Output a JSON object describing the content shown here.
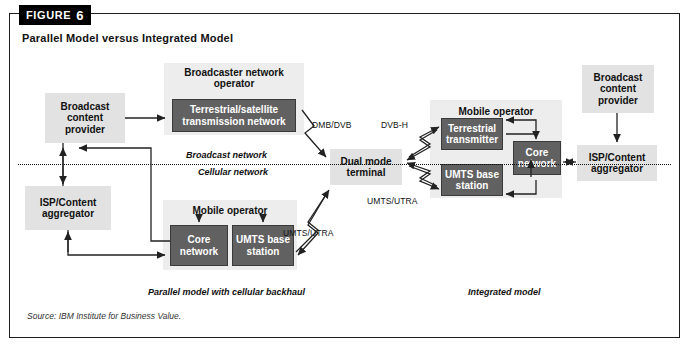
{
  "figure": {
    "tab_word": "FIGURE",
    "tab_number": "6",
    "title": "Parallel Model versus Integrated Model"
  },
  "divider": {
    "above_label": "Broadcast network",
    "below_label": "Cellular network"
  },
  "nodes": {
    "broadcast_content_provider_left": "Broadcast\ncontent\nprovider",
    "broadcaster_network_operator_label": "Broadcaster network\noperator",
    "terrestrial_satellite_transmission_network": "Terrestrial/satellite\ntransmission network",
    "isp_content_aggregator_left": "ISP/Content\naggregator",
    "mobile_operator_left_label": "Mobile operator",
    "core_network_left": "Core\nnetwork",
    "umts_base_station_left": "UMTS base\nstation",
    "dual_mode_terminal": "Dual mode\nterminal",
    "mobile_operator_right_label": "Mobile operator",
    "terrestrial_transmitter": "Terrestrial\ntransmitter",
    "umts_base_station_right": "UMTS base\nstation",
    "core_network_right": "Core\nnetwork",
    "broadcast_content_provider_right": "Broadcast\ncontent\nprovider",
    "isp_content_aggregator_right": "ISP/Content\naggregator"
  },
  "link_labels": {
    "dmb_dvb": "DMB/DVB",
    "dvb_h": "DVB-H",
    "umts_utra_right": "UMTS/UTRA",
    "umts_utra_left": "UMTS/UTRA"
  },
  "captions": {
    "left": "Parallel model with cellular backhaul",
    "right": "Integrated model"
  },
  "source": "Source: IBM Institute for Business Value.",
  "colors": {
    "dark_box": "#616161",
    "light_box": "#e2e2e2",
    "group_box": "#ededed",
    "tab_background": "#000000",
    "border": "#1d1d1d"
  }
}
